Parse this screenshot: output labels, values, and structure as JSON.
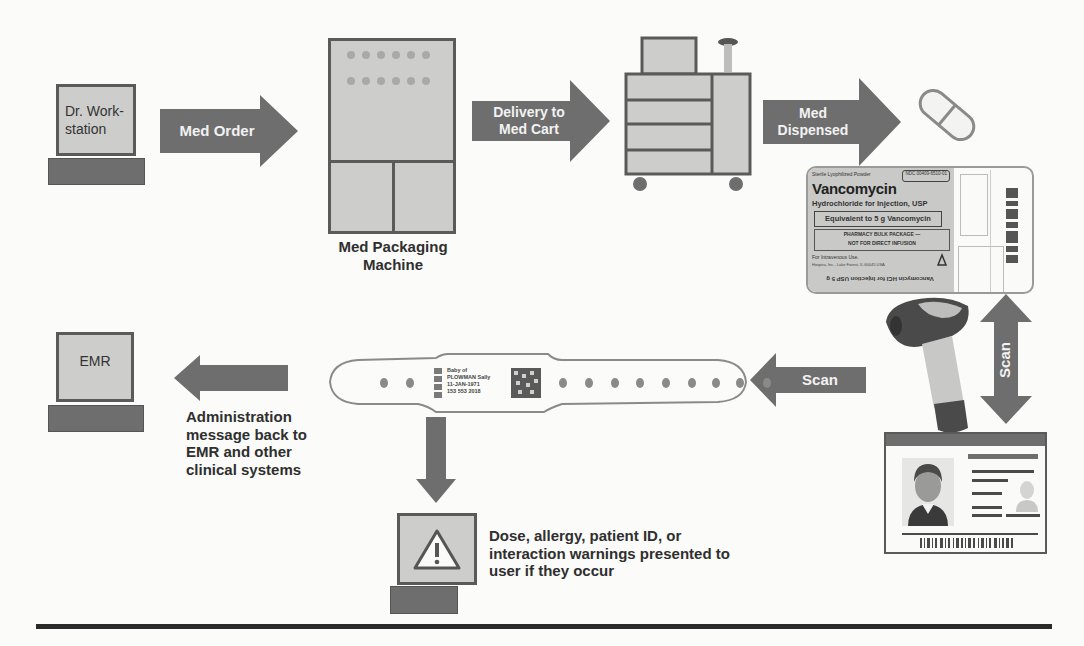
{
  "diagram": {
    "colors": {
      "arrow": "#6e6e6e",
      "arrow_text": "#f2f2f2",
      "device_fill": "#cdcdcb",
      "device_border": "#5a5a5a",
      "keyboard": "#6e6e6e",
      "caption_text": "#2f2f2f",
      "rule": "#2a2a2a"
    },
    "nodes": {
      "dr_workstation": {
        "label": "Dr. Work-\nstation",
        "line1": "Dr. Work-",
        "line2": "station"
      },
      "packaging_machine": {
        "caption_line1": "Med Packaging",
        "caption_line2": "Machine"
      },
      "med_cart": {
        "label": "Med Cart"
      },
      "pill": {
        "label": "Medication"
      },
      "vial_label": {
        "top_text": "Sterile Lyophilized Powder",
        "ndc": "NDC 00409-6510-01",
        "drug_name": "Vancomycin",
        "subtitle": "Hydrochloride for Injection, USP",
        "strength": "Equivalent to 5 g Vancomycin",
        "package_line1": "PHARMACY BULK PACKAGE —",
        "package_line2": "NOT FOR DIRECT INFUSION",
        "route": "For Intravenous Use.",
        "manufacturer": "Hospira, Inc., Lake Forest, IL 60045 USA",
        "bottom_mirrored": "Vancomycin HCl for Injection USP 5 g"
      },
      "wristband": {
        "line1": "Baby of",
        "line2": "PLOWMAN Sally",
        "line3": "11-JAN-1971",
        "line4": "153 553 2018"
      },
      "emr": {
        "label": "EMR"
      },
      "scanner": {
        "label": "Barcode scanner"
      },
      "id_card": {
        "label": "Staff ID badge"
      },
      "warning_station": {
        "label": "Warning"
      }
    },
    "arrows": {
      "med_order": {
        "label": "Med Order"
      },
      "delivery": {
        "line1": "Delivery to",
        "line2": "Med Cart"
      },
      "dispensed": {
        "line1": "Med",
        "line2": "Dispensed"
      },
      "scan_left": {
        "label": "Scan"
      },
      "scan_vertical": {
        "label": "Scan"
      }
    },
    "captions": {
      "admin_message": [
        "Administration",
        "message back to",
        "EMR and other",
        "clinical  systems"
      ],
      "warnings": [
        "Dose, allergy, patient ID, or",
        "interaction warnings presented to",
        "user if they occur"
      ]
    }
  }
}
